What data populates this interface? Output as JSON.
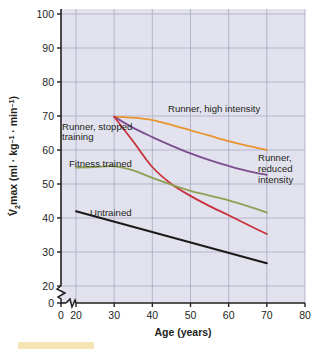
{
  "chart_data": {
    "type": "line",
    "title": "",
    "xlabel": "Age (years)",
    "ylabel": "V̇O₂max (ml · kg⁻¹ · min⁻¹)",
    "xlim": [
      0,
      80
    ],
    "ylim": [
      0,
      100
    ],
    "x_ticks": [
      0,
      20,
      30,
      40,
      50,
      60,
      70,
      80
    ],
    "y_ticks": [
      0,
      20,
      30,
      40,
      50,
      60,
      70,
      80,
      90,
      100
    ],
    "axis_break_x": true,
    "axis_break_y": true,
    "grid": true,
    "legend_position": "inline-annotations",
    "series": [
      {
        "name": "Runner, high intensity",
        "color": "#E8942F",
        "label_x": 43,
        "label_y": 74,
        "x": [
          30,
          35,
          40,
          45,
          50,
          55,
          60,
          65,
          70
        ],
        "values": [
          69.8,
          69.5,
          68.8,
          67.4,
          65.8,
          64.2,
          62.6,
          61.2,
          60.0
        ]
      },
      {
        "name": "Runner, reduced intensity",
        "color": "#7B4E8E",
        "label_x": 63,
        "label_y": 52,
        "x": [
          30,
          35,
          40,
          45,
          50,
          55,
          60,
          65,
          70
        ],
        "values": [
          69.8,
          66.5,
          63.8,
          61.3,
          59.0,
          57.0,
          55.3,
          53.8,
          52.7
        ]
      },
      {
        "name": "Runner, stopped training",
        "color": "#C8323C",
        "label_x": 22,
        "label_y": 62,
        "x": [
          30,
          35,
          40,
          45,
          50,
          55,
          60,
          65,
          70
        ],
        "values": [
          69.8,
          62.5,
          55.0,
          50.0,
          46.5,
          43.5,
          40.8,
          38.0,
          35.3
        ]
      },
      {
        "name": "Fitness trained",
        "color": "#8FA055",
        "label_x": 24,
        "label_y": 51,
        "x": [
          20,
          25,
          30,
          35,
          40,
          45,
          50,
          55,
          60,
          65,
          70
        ],
        "values": [
          54.8,
          55.0,
          55.2,
          54.0,
          51.8,
          49.8,
          48.0,
          46.6,
          45.2,
          43.5,
          41.6
        ]
      },
      {
        "name": "Untrained",
        "color": "#1a1a1a",
        "label_x": 29,
        "label_y": 36,
        "x": [
          20,
          70
        ],
        "values": [
          42.0,
          26.7
        ]
      }
    ]
  },
  "axis": {
    "x_title": "Age (years)",
    "y_title_parts": {
      "main": "VO",
      "sub": "2",
      "rest": "max (ml · kg",
      "sup1": "–1",
      "mid": " · min",
      "sup2": "–1",
      "close": ")"
    },
    "x_tick_labels": [
      "0",
      "20",
      "30",
      "40",
      "50",
      "60",
      "70",
      "80"
    ],
    "y_tick_labels": [
      "0",
      "20",
      "30",
      "40",
      "50",
      "60",
      "70",
      "80",
      "90",
      "100"
    ]
  },
  "annotations": {
    "runner_high": "Runner, high intensity",
    "runner_stopped_line1": "Runner, stopped",
    "runner_stopped_line2": "training",
    "fitness_trained": "Fitness trained",
    "runner_reduced_line1": "Runner,",
    "runner_reduced_line2": "reduced",
    "runner_reduced_line3": "intensity",
    "untrained": "Untrained"
  },
  "colors": {
    "plot_background": "#E2E2EE",
    "grid": "#A9A9BE",
    "axis": "#231f20",
    "page_background": "#FFFFFF",
    "footer_strip": "#F2DC9B",
    "runner_high_intensity": "#E8942F",
    "runner_reduced_intensity": "#7B4E8E",
    "runner_stopped_training": "#C8323C",
    "fitness_trained": "#8FA055",
    "untrained": "#1a1a1a"
  }
}
